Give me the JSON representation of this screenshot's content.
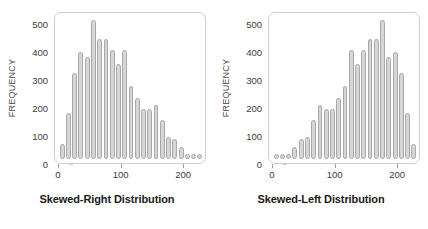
{
  "figure": {
    "background_color": "#ffffff",
    "bar_fill_color": "#d6d6d6",
    "bar_stroke_color": "#a8a8a8",
    "frame_color": "#cfcfcf",
    "text_color": "#3b3b3b",
    "caption_color": "#1a1a1a"
  },
  "chart_data": [
    {
      "type": "bar",
      "title": "Skewed-Right Distribution",
      "xlabel": "",
      "ylabel": "FREQUENCY",
      "ylim": [
        0,
        530
      ],
      "xlim": [
        -5,
        232
      ],
      "grid": false,
      "legend": false,
      "ytick_labels": [
        "0",
        "100",
        "200",
        "300",
        "400",
        "500"
      ],
      "ytick_values": [
        0,
        100,
        200,
        300,
        400,
        500
      ],
      "xtick_labels": [
        "0",
        "100",
        "200"
      ],
      "xtick_values": [
        0,
        100,
        200
      ],
      "categories": [
        5,
        15,
        25,
        35,
        45,
        55,
        65,
        75,
        85,
        95,
        105,
        115,
        125,
        135,
        145,
        155,
        165,
        175,
        185,
        195,
        205,
        215,
        225
      ],
      "values": [
        55,
        170,
        315,
        395,
        375,
        510,
        440,
        440,
        400,
        350,
        400,
        270,
        225,
        185,
        185,
        200,
        145,
        80,
        75,
        45,
        10,
        10,
        10
      ]
    },
    {
      "type": "bar",
      "title": "Skewed-Left Distribution",
      "xlabel": "",
      "ylabel": "FREQUENCY",
      "ylim": [
        0,
        530
      ],
      "xlim": [
        -5,
        232
      ],
      "grid": false,
      "legend": false,
      "ytick_labels": [
        "0",
        "100",
        "200",
        "300",
        "400",
        "500"
      ],
      "ytick_values": [
        0,
        100,
        200,
        300,
        400,
        500
      ],
      "xtick_labels": [
        "0",
        "100",
        "200"
      ],
      "xtick_values": [
        0,
        100,
        200
      ],
      "categories": [
        5,
        15,
        25,
        35,
        45,
        55,
        65,
        75,
        85,
        95,
        105,
        115,
        125,
        135,
        145,
        155,
        165,
        175,
        185,
        195,
        205,
        215,
        225
      ],
      "values": [
        10,
        10,
        10,
        45,
        75,
        80,
        145,
        200,
        185,
        185,
        225,
        270,
        400,
        350,
        400,
        440,
        440,
        510,
        375,
        395,
        315,
        170,
        55
      ]
    }
  ]
}
